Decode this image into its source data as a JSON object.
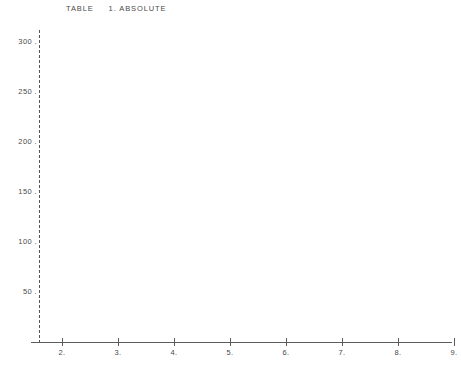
{
  "title": "TABLE     1. ABSOLUTE",
  "axis": {
    "y_ticks": [
      {
        "label": "300 .",
        "value": 300
      },
      {
        "label": "250 .",
        "value": 250
      },
      {
        "label": "200 .",
        "value": 200
      },
      {
        "label": "150 .",
        "value": 150
      },
      {
        "label": "100 .",
        "value": 100
      },
      {
        "label": "50 .",
        "value": 50
      }
    ],
    "x_ticks": [
      {
        "label": "2.",
        "value": 2
      },
      {
        "label": "3.",
        "value": 3
      },
      {
        "label": "4.",
        "value": 4
      },
      {
        "label": "5.",
        "value": 5
      },
      {
        "label": "6.",
        "value": 6
      },
      {
        "label": "7.",
        "value": 7
      },
      {
        "label": "8.",
        "value": 8
      },
      {
        "label": "9.",
        "value": 9
      }
    ]
  },
  "colors": {
    "bar_fill": "#111111",
    "axis": "#5c5c5c",
    "text": "#4a4a4a",
    "background": "#ffffff"
  },
  "chart_data": {
    "type": "bar",
    "title": "TABLE     1. ABSOLUTE",
    "xlabel": "",
    "ylabel": "",
    "categories": [
      "3",
      "4",
      "5",
      "6",
      "7",
      "8"
    ],
    "values": [
      250,
      237,
      222,
      190,
      156,
      168
    ],
    "xlim": [
      2,
      9
    ],
    "ylim": [
      0,
      300
    ],
    "yticks": [
      50,
      100,
      150,
      200,
      250,
      300
    ],
    "xticks": [
      2,
      3,
      4,
      5,
      6,
      7,
      8,
      9
    ],
    "grid": false,
    "legend": false,
    "bar_style": "dotted-ascii-fill"
  }
}
